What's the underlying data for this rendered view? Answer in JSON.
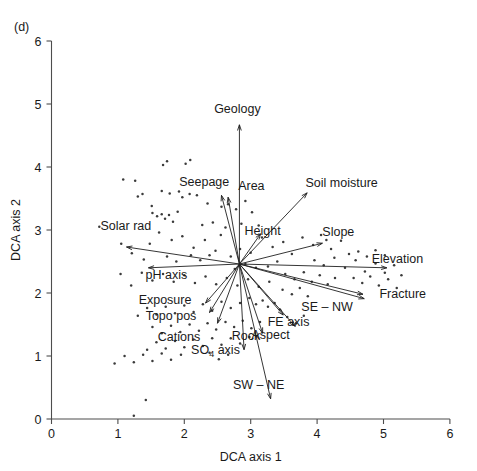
{
  "panel": {
    "label": "(d)"
  },
  "axes": {
    "x": {
      "title": "DCA axis 1",
      "min": 0,
      "max": 6,
      "ticks": [
        "0",
        "1",
        "2",
        "3",
        "4",
        "5",
        "6"
      ]
    },
    "y": {
      "title": "DCA axis 2",
      "min": 0,
      "max": 6,
      "ticks": [
        "0",
        "1",
        "2",
        "3",
        "4",
        "5",
        "6"
      ]
    }
  },
  "chart_data": {
    "type": "scatter",
    "title": "(d)",
    "xlabel": "DCA axis 1",
    "ylabel": "DCA axis 2",
    "xlim": [
      0,
      6
    ],
    "ylim": [
      0,
      6
    ],
    "grid": false,
    "legend": "none",
    "origin": {
      "x": 2.83,
      "y": 2.46
    },
    "vectors": [
      {
        "name": "Geology",
        "label": "Geology",
        "tip": [
          2.83,
          4.67
        ],
        "label_xy": [
          2.8,
          4.85
        ],
        "anchor": "middle"
      },
      {
        "name": "Seepage",
        "label": "Seepage",
        "tip": [
          2.56,
          3.55
        ],
        "label_xy": [
          2.3,
          3.7
        ],
        "anchor": "middle"
      },
      {
        "name": "Area",
        "label": "Area",
        "tip": [
          2.66,
          3.52
        ],
        "label_xy": [
          3.01,
          3.64
        ],
        "anchor": "middle"
      },
      {
        "name": "Soil moisture",
        "label": "Soil moisture",
        "tip": [
          3.85,
          3.59
        ],
        "label_xy": [
          4.37,
          3.69
        ],
        "anchor": "middle"
      },
      {
        "name": "Solar rad",
        "label": "Solar rad",
        "tip": [
          1.13,
          2.73
        ],
        "label_xy": [
          1.12,
          3.0
        ],
        "anchor": "middle"
      },
      {
        "name": "Height",
        "label": "Height",
        "tip": [
          3.15,
          2.94
        ],
        "label_xy": [
          3.18,
          2.92
        ],
        "anchor": "middle"
      },
      {
        "name": "Slope",
        "label": "Slope",
        "tip": [
          4.08,
          2.79
        ],
        "label_xy": [
          4.32,
          2.9
        ],
        "anchor": "middle"
      },
      {
        "name": "Elevation",
        "label": "Elevation",
        "tip": [
          5.05,
          2.4
        ],
        "label_xy": [
          5.21,
          2.48
        ],
        "anchor": "middle"
      },
      {
        "name": "pH axis",
        "label": "pH axis",
        "tip": [
          1.46,
          2.4
        ],
        "label_xy": [
          1.73,
          2.22
        ],
        "anchor": "middle"
      },
      {
        "name": "Fracture",
        "label": "Fracture",
        "tip": [
          4.69,
          1.98
        ],
        "label_xy": [
          5.29,
          1.92
        ],
        "anchor": "middle"
      },
      {
        "name": "SE – NW",
        "label": "SE – NW",
        "tip": [
          4.71,
          1.91
        ],
        "label_xy": [
          4.15,
          1.71
        ],
        "anchor": "middle"
      },
      {
        "name": "Exposure",
        "label": "Exposure",
        "tip": [
          2.32,
          1.84
        ],
        "label_xy": [
          1.71,
          1.82
        ],
        "anchor": "middle"
      },
      {
        "name": "Topo pos",
        "label": "Topo pos",
        "tip": [
          2.38,
          1.69
        ],
        "label_xy": [
          1.8,
          1.57
        ],
        "anchor": "middle"
      },
      {
        "name": "FE axis",
        "label": "FE axis",
        "tip": [
          3.49,
          1.65
        ],
        "label_xy": [
          3.57,
          1.48
        ],
        "anchor": "middle"
      },
      {
        "name": "Aspect",
        "label": "Aspect",
        "tip": [
          3.67,
          1.47
        ],
        "label_xy": [
          3.3,
          1.27
        ],
        "anchor": "middle"
      },
      {
        "name": "Rock",
        "label": "Rock",
        "tip": [
          3.18,
          1.36
        ],
        "label_xy": [
          2.93,
          1.25
        ],
        "anchor": "middle"
      },
      {
        "name": "Cations",
        "label": "Cations",
        "tip": [
          2.5,
          1.52
        ],
        "label_xy": [
          1.92,
          1.24
        ],
        "anchor": "middle"
      },
      {
        "name": "SO4 axis",
        "label": "SO",
        "label2": "4",
        "label3": " axis",
        "tip": [
          2.9,
          1.1
        ],
        "label_xy": [
          2.47,
          1.03
        ],
        "anchor": "middle"
      },
      {
        "name": "SW – NE",
        "label": "SW – NE",
        "tip": [
          3.3,
          0.32
        ],
        "label_xy": [
          3.12,
          0.48
        ],
        "anchor": "middle"
      }
    ],
    "points": [
      [
        0.72,
        3.05
      ],
      [
        1.08,
        3.8
      ],
      [
        1.26,
        3.78
      ],
      [
        1.3,
        3.53
      ],
      [
        1.37,
        3.57
      ],
      [
        1.51,
        3.38
      ],
      [
        1.68,
        4.03
      ],
      [
        1.74,
        4.09
      ],
      [
        2.02,
        4.05
      ],
      [
        2.09,
        4.11
      ],
      [
        1.66,
        3.62
      ],
      [
        1.78,
        3.58
      ],
      [
        1.92,
        3.61
      ],
      [
        1.97,
        3.52
      ],
      [
        2.08,
        3.57
      ],
      [
        2.19,
        3.55
      ],
      [
        1.52,
        3.27
      ],
      [
        1.59,
        3.22
      ],
      [
        1.66,
        3.25
      ],
      [
        1.71,
        3.18
      ],
      [
        1.77,
        3.24
      ],
      [
        1.83,
        3.13
      ],
      [
        1.9,
        3.29
      ],
      [
        2.35,
        3.42
      ],
      [
        2.27,
        3.08
      ],
      [
        2.43,
        3.12
      ],
      [
        2.56,
        3.37
      ],
      [
        2.66,
        3.41
      ],
      [
        2.62,
        3.04
      ],
      [
        2.78,
        3.33
      ],
      [
        2.92,
        3.46
      ],
      [
        2.86,
        3.1
      ],
      [
        3.02,
        3.28
      ],
      [
        3.12,
        3.07
      ],
      [
        1.05,
        2.78
      ],
      [
        1.21,
        2.63
      ],
      [
        1.39,
        2.53
      ],
      [
        1.48,
        2.78
      ],
      [
        1.62,
        2.96
      ],
      [
        1.81,
        2.84
      ],
      [
        1.97,
        2.9
      ],
      [
        2.14,
        2.72
      ],
      [
        2.31,
        2.84
      ],
      [
        2.47,
        2.67
      ],
      [
        2.55,
        2.92
      ],
      [
        2.7,
        2.58
      ],
      [
        2.84,
        2.7
      ],
      [
        3.0,
        2.64
      ],
      [
        3.17,
        2.88
      ],
      [
        3.33,
        2.73
      ],
      [
        3.49,
        2.81
      ],
      [
        3.62,
        2.62
      ],
      [
        3.78,
        2.88
      ],
      [
        3.94,
        2.76
      ],
      [
        4.06,
        2.92
      ],
      [
        4.14,
        2.84
      ],
      [
        4.21,
        2.7
      ],
      [
        4.36,
        2.83
      ],
      [
        4.48,
        2.62
      ],
      [
        3.96,
        2.52
      ],
      [
        4.1,
        2.44
      ],
      [
        4.26,
        2.56
      ],
      [
        4.42,
        2.4
      ],
      [
        4.58,
        2.52
      ],
      [
        4.72,
        2.34
      ],
      [
        4.88,
        2.47
      ],
      [
        5.02,
        2.32
      ],
      [
        5.16,
        2.44
      ],
      [
        5.27,
        2.28
      ],
      [
        4.55,
        2.24
      ],
      [
        4.68,
        2.16
      ],
      [
        4.8,
        2.26
      ],
      [
        4.93,
        2.12
      ],
      [
        5.07,
        2.22
      ],
      [
        5.2,
        2.08
      ],
      [
        3.52,
        2.3
      ],
      [
        3.66,
        2.22
      ],
      [
        3.8,
        2.33
      ],
      [
        3.92,
        2.18
      ],
      [
        4.04,
        2.28
      ],
      [
        4.16,
        2.14
      ],
      [
        4.27,
        2.24
      ],
      [
        3.48,
        2.05
      ],
      [
        3.62,
        1.98
      ],
      [
        3.74,
        2.08
      ],
      [
        3.86,
        1.95
      ],
      [
        3.28,
        2.18
      ],
      [
        3.12,
        2.1
      ],
      [
        2.96,
        2.22
      ],
      [
        2.8,
        2.12
      ],
      [
        2.64,
        2.24
      ],
      [
        2.48,
        2.14
      ],
      [
        2.32,
        2.26
      ],
      [
        2.16,
        2.16
      ],
      [
        2.0,
        2.28
      ],
      [
        1.84,
        2.18
      ],
      [
        1.68,
        2.3
      ],
      [
        1.52,
        2.2
      ],
      [
        1.36,
        2.32
      ],
      [
        1.2,
        2.12
      ],
      [
        1.04,
        2.3
      ],
      [
        2.98,
        1.92
      ],
      [
        3.08,
        1.82
      ],
      [
        3.18,
        1.88
      ],
      [
        3.26,
        1.78
      ],
      [
        3.36,
        1.84
      ],
      [
        3.44,
        1.74
      ],
      [
        2.84,
        1.84
      ],
      [
        2.7,
        1.76
      ],
      [
        2.56,
        1.86
      ],
      [
        2.42,
        1.72
      ],
      [
        2.28,
        1.82
      ],
      [
        2.14,
        1.7
      ],
      [
        2.0,
        1.8
      ],
      [
        1.86,
        1.68
      ],
      [
        1.72,
        1.78
      ],
      [
        1.58,
        1.66
      ],
      [
        1.44,
        1.76
      ],
      [
        1.3,
        1.64
      ],
      [
        3.55,
        1.62
      ],
      [
        3.68,
        1.52
      ],
      [
        3.8,
        1.64
      ],
      [
        2.62,
        1.54
      ],
      [
        2.75,
        1.46
      ],
      [
        2.88,
        1.56
      ],
      [
        3.01,
        1.44
      ],
      [
        3.14,
        1.54
      ],
      [
        2.48,
        1.42
      ],
      [
        2.35,
        1.52
      ],
      [
        2.22,
        1.4
      ],
      [
        2.08,
        1.5
      ],
      [
        1.94,
        1.38
      ],
      [
        1.8,
        1.48
      ],
      [
        1.66,
        1.36
      ],
      [
        1.52,
        1.46
      ],
      [
        2.7,
        1.28
      ],
      [
        2.84,
        1.2
      ],
      [
        2.98,
        1.3
      ],
      [
        2.56,
        1.18
      ],
      [
        2.42,
        1.28
      ],
      [
        2.28,
        1.16
      ],
      [
        2.14,
        1.26
      ],
      [
        2.0,
        1.14
      ],
      [
        1.86,
        1.24
      ],
      [
        1.72,
        1.12
      ],
      [
        1.58,
        1.22
      ],
      [
        1.44,
        1.1
      ],
      [
        2.66,
        1.02
      ],
      [
        2.52,
        0.95
      ],
      [
        2.38,
        1.05
      ],
      [
        1.95,
        1.02
      ],
      [
        1.8,
        0.94
      ],
      [
        1.66,
        1.04
      ],
      [
        1.52,
        0.92
      ],
      [
        1.38,
        1.02
      ],
      [
        1.24,
        0.9
      ],
      [
        1.1,
        1.0
      ],
      [
        0.95,
        0.88
      ],
      [
        1.42,
        0.3
      ],
      [
        1.24,
        0.05
      ],
      [
        3.26,
        2.42
      ],
      [
        3.4,
        2.5
      ],
      [
        3.08,
        2.4
      ],
      [
        2.92,
        2.46
      ],
      [
        2.76,
        2.38
      ],
      [
        4.62,
        2.66
      ],
      [
        4.75,
        2.58
      ],
      [
        4.88,
        2.68
      ],
      [
        5.02,
        2.6
      ],
      [
        2.1,
        2.6
      ],
      [
        2.24,
        2.52
      ],
      [
        2.38,
        2.6
      ],
      [
        1.88,
        2.5
      ],
      [
        1.74,
        2.58
      ]
    ]
  }
}
